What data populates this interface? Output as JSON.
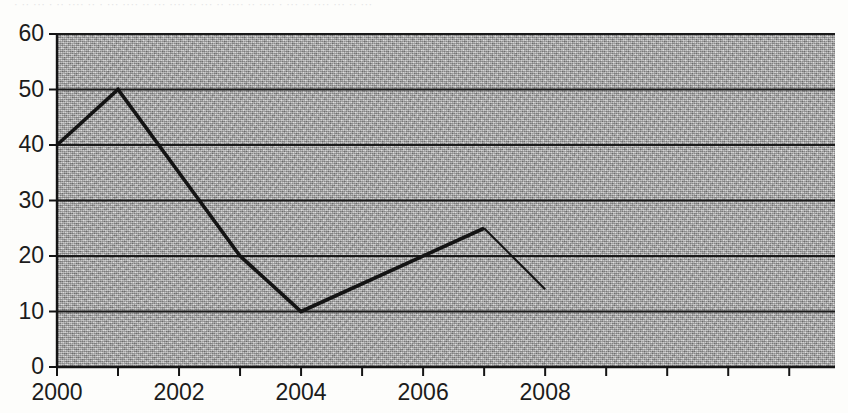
{
  "page": {
    "background_color": "#fdfdfb",
    "top_cut_text": "· ··  ··· · ··  ···· ·· ·  ··· ····  ·· ···  ···· ··  ··· ·· ····  ·· ···· ·  ···  ·· ····  ··· ·· ···"
  },
  "chart_data": {
    "type": "line",
    "title": "",
    "subtitle": "",
    "xlabel": "",
    "ylabel": "",
    "xlim": [
      2000,
      2012.75
    ],
    "ylim": [
      0,
      60
    ],
    "yticks": [
      0,
      10,
      20,
      30,
      40,
      50,
      60
    ],
    "ytick_labels": [
      "0",
      "10",
      "20",
      "30",
      "40",
      "50",
      "60"
    ],
    "xticks": [
      2000,
      2001,
      2002,
      2003,
      2004,
      2005,
      2006,
      2007,
      2008,
      2009,
      2010,
      2011,
      2012
    ],
    "xtick_labels": [
      "2000",
      "",
      "2002",
      "",
      "2004",
      "",
      "2006",
      "",
      "2008",
      "",
      "",
      "",
      ""
    ],
    "xtick_labels_shown": [
      "2000",
      "2002",
      "2004",
      "2006",
      "2008"
    ],
    "grid": true,
    "grid_axis": "y",
    "grid_color": "#1a1a1a",
    "legend": false,
    "legend_position": "none",
    "plot_background_color": "#a9a9a9",
    "line_color": "#141414",
    "series": [
      {
        "name": "series-1",
        "x": [
          2000,
          2001,
          2002,
          2003,
          2004,
          2007,
          2008
        ],
        "values": [
          40,
          50,
          35,
          20,
          10,
          25,
          14
        ],
        "markers": false
      }
    ],
    "annotations": []
  }
}
